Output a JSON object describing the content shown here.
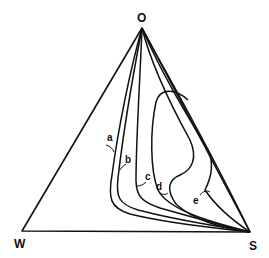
{
  "diagram": {
    "type": "ternary phase diagram",
    "vertices": {
      "top": "O",
      "left": "W",
      "right": "S"
    },
    "curves": [
      {
        "label": "a"
      },
      {
        "label": "b"
      },
      {
        "label": "c"
      },
      {
        "label": "d"
      },
      {
        "label": "e"
      }
    ],
    "colors": {
      "line": "#111111",
      "background": "#ffffff"
    }
  }
}
